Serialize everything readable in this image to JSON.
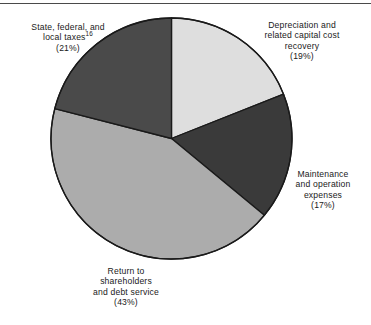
{
  "figure": {
    "background_color": "#ffffff",
    "rule_color": "#4a4a4a",
    "outline_color": "#1a1a1a"
  },
  "chart_data": {
    "type": "pie",
    "title": "",
    "subtitle": "",
    "xlabel": "",
    "ylabel": "",
    "legend_position": "none",
    "grid": false,
    "start_angle_deg": 0,
    "direction": "clockwise",
    "categories": [
      "Depreciation and related capital cost recovery",
      "Maintenance and operation expenses",
      "Return to shareholders and debt service",
      "State, federal, and local taxes"
    ],
    "values": [
      19,
      17,
      43,
      21
    ],
    "value_unit": "percent",
    "colors": [
      "#dedede",
      "#3a3a3a",
      "#acacac",
      "#4a4a4a"
    ],
    "slices": [
      {
        "name": "depreciation",
        "value": 19,
        "percent_text": "(19%)",
        "color": "#dedede",
        "label_lines": [
          "Depreciation and",
          "related capital cost",
          "recovery",
          "(19%)"
        ],
        "start_deg": 0,
        "end_deg": 68.4
      },
      {
        "name": "maintenance",
        "value": 17,
        "percent_text": "(17%)",
        "color": "#3a3a3a",
        "label_lines": [
          "Maintenance",
          "and operation",
          "expenses",
          "(17%)"
        ],
        "start_deg": 68.4,
        "end_deg": 129.6
      },
      {
        "name": "return-to-shareholders",
        "value": 43,
        "percent_text": "(43%)",
        "color": "#acacac",
        "label_lines": [
          "Return to",
          "shareholders",
          "and debt service",
          "(43%)"
        ],
        "start_deg": 129.6,
        "end_deg": 284.4
      },
      {
        "name": "state-federal-local-taxes",
        "value": 21,
        "percent_text": "(21%)",
        "color": "#4a4a4a",
        "label_footnote": "16",
        "label_lines": [
          "State, federal, and",
          "local taxes",
          "(21%)"
        ],
        "start_deg": 284.4,
        "end_deg": 360
      }
    ]
  },
  "labels": {
    "taxes": {
      "line1": "State, federal, and",
      "line2": "local taxes",
      "footnote": "16",
      "line3": "(21%)"
    },
    "depreciation": {
      "line1": "Depreciation and",
      "line2": "related capital cost",
      "line3": "recovery",
      "line4": "(19%)"
    },
    "maintenance": {
      "line1": "Maintenance",
      "line2": "and operation",
      "line3": "expenses",
      "line4": "(17%)"
    },
    "return": {
      "line1": "Return to",
      "line2": "shareholders",
      "line3": "and debt service",
      "line4": "(43%)"
    }
  }
}
